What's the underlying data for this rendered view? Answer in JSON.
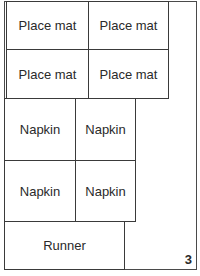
{
  "diagram": {
    "pieces": [
      {
        "label": "Place mat"
      },
      {
        "label": "Place mat"
      },
      {
        "label": "Place mat"
      },
      {
        "label": "Place mat"
      },
      {
        "label": "Napkin"
      },
      {
        "label": "Napkin"
      },
      {
        "label": "Napkin"
      },
      {
        "label": "Napkin"
      },
      {
        "label": "Runner"
      }
    ],
    "figure_number": "3"
  }
}
